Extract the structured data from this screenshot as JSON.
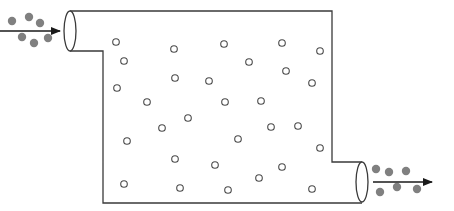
{
  "diagram": {
    "colors": {
      "outline": "#3a3a3a",
      "filled_particle": "#808080",
      "hollow_particle": "#4a4a4a",
      "arrow": "#1a1a1a",
      "background": "#ffffff"
    },
    "inlet": {
      "arrow": {
        "x1": 0,
        "y1": 31,
        "x2": 60,
        "y2": 31
      },
      "ellipse": {
        "cx": 70,
        "cy": 31,
        "rx": 6,
        "ry": 20
      },
      "particles": [
        [
          12,
          21
        ],
        [
          29,
          17
        ],
        [
          40,
          23
        ],
        [
          22,
          37
        ],
        [
          34,
          43
        ],
        [
          48,
          38
        ]
      ]
    },
    "outlet": {
      "arrow": {
        "x1": 373,
        "y1": 182,
        "x2": 432,
        "y2": 182
      },
      "ellipse": {
        "cx": 362,
        "cy": 182,
        "rx": 6,
        "ry": 20
      },
      "particles": [
        [
          376,
          169
        ],
        [
          389,
          172
        ],
        [
          406,
          171
        ],
        [
          380,
          192
        ],
        [
          397,
          187
        ],
        [
          417,
          189
        ]
      ]
    },
    "chamber": {
      "outline_path": "M70 11 L332 11 L332 162 L362 162 M362 203 L103 203 L103 51 L70 51"
    },
    "hollow_particles": [
      [
        116,
        42
      ],
      [
        124,
        61
      ],
      [
        117,
        88
      ],
      [
        174,
        49
      ],
      [
        224,
        44
      ],
      [
        282,
        43
      ],
      [
        320,
        51
      ],
      [
        249,
        62
      ],
      [
        286,
        71
      ],
      [
        175,
        78
      ],
      [
        209,
        81
      ],
      [
        312,
        83
      ],
      [
        147,
        102
      ],
      [
        225,
        102
      ],
      [
        261,
        101
      ],
      [
        188,
        118
      ],
      [
        162,
        128
      ],
      [
        271,
        127
      ],
      [
        298,
        126
      ],
      [
        127,
        141
      ],
      [
        238,
        139
      ],
      [
        320,
        148
      ],
      [
        175,
        159
      ],
      [
        215,
        165
      ],
      [
        282,
        167
      ],
      [
        259,
        178
      ],
      [
        124,
        184
      ],
      [
        180,
        188
      ],
      [
        228,
        190
      ],
      [
        312,
        189
      ]
    ]
  }
}
